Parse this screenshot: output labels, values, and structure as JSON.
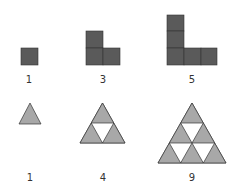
{
  "squares": {
    "labels": [
      "1",
      "3",
      "5"
    ],
    "fill": "#5a5a5a",
    "stroke": "#333333"
  },
  "triangles": {
    "labels": [
      "1",
      "4",
      "9"
    ],
    "fill": "#a8a8a8",
    "stroke": "#333333"
  }
}
